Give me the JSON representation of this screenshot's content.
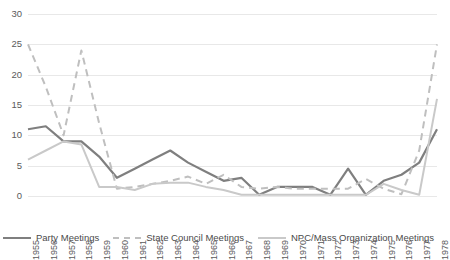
{
  "chart_data": {
    "type": "line",
    "title": "",
    "xlabel": "",
    "ylabel": "",
    "ylim": [
      0,
      30
    ],
    "ytick_values": [
      0,
      5,
      10,
      15,
      20,
      25,
      30
    ],
    "grid": true,
    "legend_position": "bottom",
    "categories": [
      "1955",
      "1956",
      "1957",
      "1958",
      "1959",
      "1960",
      "1961",
      "1962",
      "1963",
      "1964",
      "1965",
      "1966",
      "1967",
      "1968",
      "1969",
      "1970",
      "1971",
      "1972",
      "1973",
      "1974",
      "1975",
      "1976",
      "1977",
      "1978"
    ],
    "series": [
      {
        "name": "Party Meetings",
        "color": "#7f7f7f",
        "style": "solid",
        "values": [
          11,
          11.5,
          9,
          9,
          6.5,
          3,
          4.5,
          6,
          7.5,
          5.5,
          4,
          2.5,
          3,
          0.2,
          1.5,
          1.5,
          1.5,
          0.2,
          4.5,
          0.2,
          2.5,
          3.5,
          5.5,
          11
        ]
      },
      {
        "name": "State Council Meetings",
        "color": "#bfbfbf",
        "style": "dashed",
        "values": [
          25,
          18,
          10,
          24,
          12,
          1.2,
          1.5,
          2,
          2.5,
          3.2,
          2,
          3.5,
          1.5,
          1.2,
          1.5,
          1.2,
          1.2,
          1.2,
          1.2,
          2.8,
          1.2,
          0.3,
          7.5,
          25
        ]
      },
      {
        "name": "NPC/Mass Organization Meetings",
        "color": "#c9c9c9",
        "style": "solid",
        "values": [
          6,
          7.5,
          9,
          8.5,
          1.5,
          1.5,
          1,
          2,
          2.2,
          2.2,
          1.5,
          1,
          0.2,
          0.2,
          0.2,
          0.2,
          0.2,
          0.2,
          0.2,
          0.2,
          2,
          1,
          0.2,
          16
        ]
      }
    ]
  },
  "legend": {
    "items": [
      {
        "label": "Party Meetings"
      },
      {
        "label": "State Council Meetings"
      },
      {
        "label": "NPC/Mass Organization Meetings"
      }
    ]
  }
}
